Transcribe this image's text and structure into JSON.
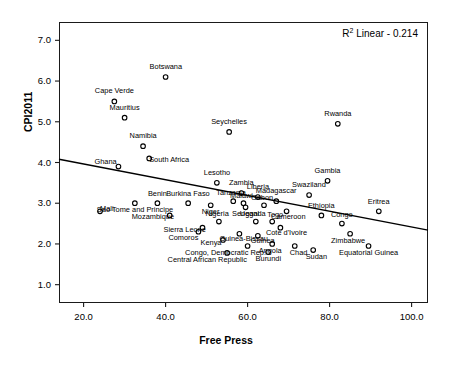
{
  "chart_data": {
    "type": "scatter",
    "title": "",
    "xlabel": "Free Press",
    "ylabel": "CPI2011",
    "xlim": [
      14.0,
      104.0
    ],
    "ylim": [
      0.55,
      7.45
    ],
    "xticks": [
      "20.0",
      "40.0",
      "60.0",
      "80.0",
      "100.0"
    ],
    "xtick_values": [
      20.0,
      40.0,
      60.0,
      80.0,
      100.0
    ],
    "yticks": [
      "1.0",
      "2.0",
      "3.0",
      "4.0",
      "5.0",
      "6.0",
      "7.0"
    ],
    "ytick_values": [
      1.0,
      2.0,
      3.0,
      4.0,
      5.0,
      6.0,
      7.0
    ],
    "grid": false,
    "legend": null,
    "annotations": [
      {
        "name": "r2-annotation",
        "text": "R2 Linear - 0.214",
        "html": "R<sup>2</sup> Linear - 0.214",
        "position": "top-right"
      }
    ],
    "fit_line": {
      "kind": "linear",
      "r_squared": 0.214,
      "x_start": 14.0,
      "y_start": 4.08,
      "x_end": 104.0,
      "y_end": 2.34
    },
    "marker": {
      "shape": "open-circle",
      "size": 4.6,
      "color": "#000000",
      "fill": "none"
    },
    "points": [
      {
        "label": "Botswana",
        "x": 40.0,
        "y": 6.1,
        "lx": 0,
        "ly": -10
      },
      {
        "label": "Cape Verde",
        "x": 27.5,
        "y": 5.5,
        "lx": 0,
        "ly": -10
      },
      {
        "label": "Mauritius",
        "x": 30.0,
        "y": 5.1,
        "lx": 0,
        "ly": -10
      },
      {
        "label": "Seychelles",
        "x": 55.5,
        "y": 4.75,
        "lx": 0,
        "ly": -10
      },
      {
        "label": "Rwanda",
        "x": 82.0,
        "y": 4.95,
        "lx": 0,
        "ly": -10
      },
      {
        "label": "Namibia",
        "x": 34.5,
        "y": 4.4,
        "lx": 0,
        "ly": -10
      },
      {
        "label": "Ghana",
        "x": 28.5,
        "y": 3.9,
        "lx": -13,
        "ly": -5
      },
      {
        "label": "South Africa",
        "x": 36.0,
        "y": 4.1,
        "lx": 20,
        "ly": 2
      },
      {
        "label": "Lesotho",
        "x": 52.5,
        "y": 3.5,
        "lx": 0,
        "ly": -10
      },
      {
        "label": "Gambia",
        "x": 79.5,
        "y": 3.55,
        "lx": 0,
        "ly": -10
      },
      {
        "label": "Zambia",
        "x": 58.5,
        "y": 3.25,
        "lx": 0,
        "ly": -10
      },
      {
        "label": "Swaziland",
        "x": 75.0,
        "y": 3.2,
        "lx": 0,
        "ly": -10
      },
      {
        "label": "Tanzania",
        "x": 56.5,
        "y": 3.05,
        "lx": -2,
        "ly": -8
      },
      {
        "label": "Liberia",
        "x": 62.5,
        "y": 3.15,
        "lx": 0,
        "ly": -10
      },
      {
        "label": "Madagascar",
        "x": 67.0,
        "y": 3.05,
        "lx": 0,
        "ly": -10
      },
      {
        "label": "Malawi",
        "x": 59.0,
        "y": 3.0,
        "lx": -2,
        "ly": -7
      },
      {
        "label": "Burkina Faso",
        "x": 45.5,
        "y": 3.0,
        "lx": 0,
        "ly": -9
      },
      {
        "label": "Benin",
        "x": 38.0,
        "y": 3.0,
        "lx": 0,
        "ly": -9
      },
      {
        "label": "Ethiopia",
        "x": 78.0,
        "y": 2.7,
        "lx": 0,
        "ly": -9
      },
      {
        "label": "Mali",
        "x": 24.0,
        "y": 2.8,
        "lx": 7,
        "ly": -2
      },
      {
        "label": "Sao Tome and Principe",
        "x": 32.5,
        "y": 3.0,
        "lx": 0,
        "ly": 7
      },
      {
        "label": "Niger",
        "x": 51.0,
        "y": 2.95,
        "lx": 0,
        "ly": 7
      },
      {
        "label": "Senegal",
        "x": 59.5,
        "y": 2.9,
        "lx": 0,
        "ly": 7
      },
      {
        "label": "Gabon",
        "x": 64.0,
        "y": 2.95,
        "lx": -2,
        "ly": -7
      },
      {
        "label": "Cameroon",
        "x": 69.5,
        "y": 2.8,
        "lx": 2,
        "ly": 6
      },
      {
        "label": "Eritrea",
        "x": 92.0,
        "y": 2.8,
        "lx": 0,
        "ly": -9
      },
      {
        "label": "Congo",
        "x": 83.0,
        "y": 2.5,
        "lx": 0,
        "ly": -9
      },
      {
        "label": "Mozambique",
        "x": 41.0,
        "y": 2.7,
        "lx": -17,
        "ly": 2
      },
      {
        "label": "Nigeria",
        "x": 53.0,
        "y": 2.55,
        "lx": -2,
        "ly": -8
      },
      {
        "label": "Uganda",
        "x": 62.0,
        "y": 2.55,
        "lx": -3,
        "ly": -8
      },
      {
        "label": "Togo",
        "x": 66.0,
        "y": 2.55,
        "lx": 3,
        "ly": -7
      },
      {
        "label": "Cote d'Ivoire",
        "x": 68.0,
        "y": 2.4,
        "lx": 6,
        "ly": 5
      },
      {
        "label": "Sierra Leone",
        "x": 49.0,
        "y": 2.4,
        "lx": -18,
        "ly": 2
      },
      {
        "label": "Comoros",
        "x": 48.0,
        "y": 2.3,
        "lx": -15,
        "ly": 6
      },
      {
        "label": "Guinea-Bissau",
        "x": 58.0,
        "y": 2.25,
        "lx": 4,
        "ly": 5
      },
      {
        "label": "Guinea",
        "x": 62.5,
        "y": 2.2,
        "lx": 5,
        "ly": 5
      },
      {
        "label": "Kenya",
        "x": 54.0,
        "y": 2.1,
        "lx": -12,
        "ly": 3
      },
      {
        "label": "Zimbabwe",
        "x": 85.0,
        "y": 2.25,
        "lx": -2,
        "ly": 7
      },
      {
        "label": "Angola",
        "x": 66.0,
        "y": 2.0,
        "lx": -2,
        "ly": 7
      },
      {
        "label": "Congo, Democratic Rep.",
        "x": 60.0,
        "y": 1.95,
        "lx": -22,
        "ly": 7
      },
      {
        "label": "Chad",
        "x": 71.5,
        "y": 1.95,
        "lx": 4,
        "ly": 7
      },
      {
        "label": "Sudan",
        "x": 76.0,
        "y": 1.85,
        "lx": 3,
        "ly": 7
      },
      {
        "label": "Burundi",
        "x": 65.0,
        "y": 1.8,
        "lx": 0,
        "ly": 7
      },
      {
        "label": "Central African Republic",
        "x": 55.0,
        "y": 1.78,
        "lx": -20,
        "ly": 7
      },
      {
        "label": "Equatorial Guinea",
        "x": 89.5,
        "y": 1.95,
        "lx": 0,
        "ly": 7
      }
    ]
  }
}
